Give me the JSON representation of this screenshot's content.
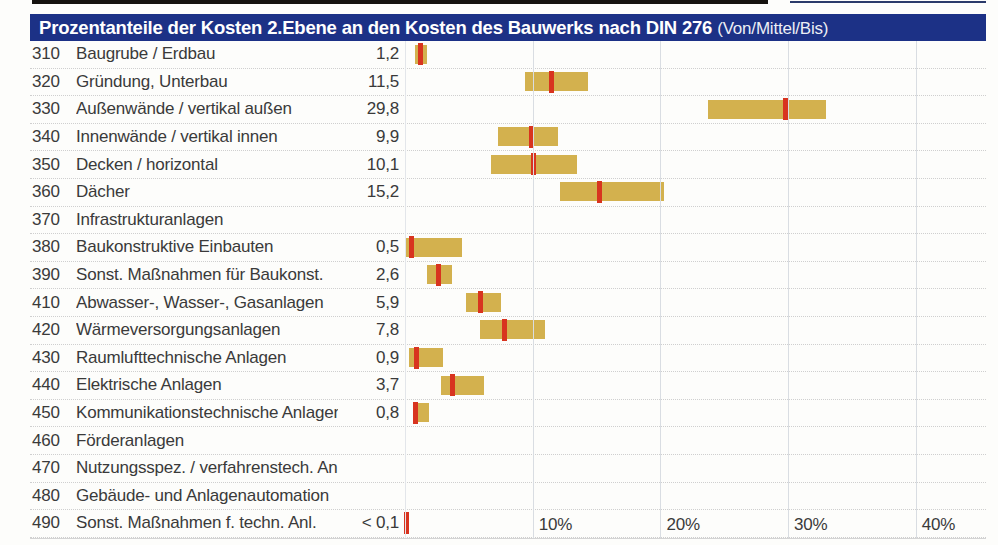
{
  "header": {
    "title_bold": "Prozentanteile der Kosten 2.Ebene an den Kosten des Bauwerks nach DIN 276",
    "title_light": "(Von/Mittel/Bis)",
    "bg_color": "#1c3186",
    "text_color": "#ffffff"
  },
  "chart_data": {
    "type": "bar",
    "subtype": "horizontal-range-bars-von-mittel-bis",
    "unit": "%",
    "xlim": [
      0,
      45.5
    ],
    "grid": "vertical-lines",
    "axis_ticks": [
      {
        "label": "10%",
        "pct": 10
      },
      {
        "label": "20%",
        "pct": 20
      },
      {
        "label": "30%",
        "pct": 30
      },
      {
        "label": "40%",
        "pct": 40
      }
    ],
    "colors": {
      "bar": "#d3b14e",
      "marker": "#d8341f",
      "grid": "#d9dde2",
      "header_bg": "#1c3186"
    },
    "rows": [
      {
        "code": "310",
        "label": "Baugrube / Erdbau",
        "value_label": "1,2",
        "von": 0.8,
        "mittel": 1.2,
        "bis": 1.7
      },
      {
        "code": "320",
        "label": "Gründung, Unterbau",
        "value_label": "11,5",
        "von": 9.4,
        "mittel": 11.5,
        "bis": 14.3
      },
      {
        "code": "330",
        "label": "Außenwände / vertikal außen",
        "value_label": "29,8",
        "von": 23.7,
        "mittel": 29.8,
        "bis": 33.0
      },
      {
        "code": "340",
        "label": "Innenwände / vertikal innen",
        "value_label": "9,9",
        "von": 7.3,
        "mittel": 9.9,
        "bis": 12.0
      },
      {
        "code": "350",
        "label": "Decken / horizontal",
        "value_label": "10,1",
        "von": 6.7,
        "mittel": 10.1,
        "bis": 13.5
      },
      {
        "code": "360",
        "label": "Dächer",
        "value_label": "15,2",
        "von": 12.1,
        "mittel": 15.2,
        "bis": 20.3
      },
      {
        "code": "370",
        "label": "Infrastrukturanlagen",
        "value_label": "",
        "von": null,
        "mittel": null,
        "bis": null
      },
      {
        "code": "380",
        "label": "Baukonstruktive Einbauten",
        "value_label": "0,5",
        "von": 0.1,
        "mittel": 0.5,
        "bis": 4.5
      },
      {
        "code": "390",
        "label": "Sonst. Maßnahmen für Baukonst.",
        "value_label": "2,6",
        "von": 1.7,
        "mittel": 2.6,
        "bis": 3.7
      },
      {
        "code": "410",
        "label": "Abwasser-, Wasser-, Gasanlagen",
        "value_label": "5,9",
        "von": 4.8,
        "mittel": 5.9,
        "bis": 7.5
      },
      {
        "code": "420",
        "label": "Wärmeversorgungsanlagen",
        "value_label": "7,8",
        "von": 5.9,
        "mittel": 7.8,
        "bis": 11.0
      },
      {
        "code": "430",
        "label": "Raumlufttechnische Anlagen",
        "value_label": "0,9",
        "von": 0.3,
        "mittel": 0.9,
        "bis": 3.0
      },
      {
        "code": "440",
        "label": "Elektrische Anlagen",
        "value_label": "3,7",
        "von": 2.8,
        "mittel": 3.7,
        "bis": 6.2
      },
      {
        "code": "450",
        "label": "Kommunikationstechnische Anlagen",
        "value_label": "0,8",
        "von": 0.6,
        "mittel": 0.8,
        "bis": 1.9
      },
      {
        "code": "460",
        "label": "Förderanlagen",
        "value_label": "",
        "von": null,
        "mittel": null,
        "bis": null
      },
      {
        "code": "470",
        "label": "Nutzungsspez. / verfahrenstech. Anl.",
        "value_label": "",
        "von": null,
        "mittel": null,
        "bis": null
      },
      {
        "code": "480",
        "label": "Gebäude- und Anlagenautomation",
        "value_label": "",
        "von": null,
        "mittel": null,
        "bis": null
      },
      {
        "code": "490",
        "label": "Sonst. Maßnahmen f. techn. Anl.",
        "value_label": "< 0,1",
        "von": null,
        "mittel": 0.15,
        "bis": null,
        "marker_only": true
      }
    ]
  }
}
